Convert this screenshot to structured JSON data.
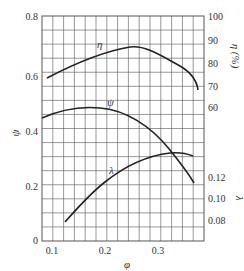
{
  "chart_data": {
    "type": "line",
    "title": "",
    "xlabel": "φ",
    "ylabel": "ψ",
    "y2labels": [
      "η (%)",
      "λ"
    ],
    "x_ticks": [
      0.1,
      0.2,
      0.3
    ],
    "xlim": [
      0.08,
      0.385
    ],
    "y_left": {
      "label": "ψ",
      "ticks": [
        "0",
        "0.2",
        "0.4",
        "0.6",
        "0.8"
      ],
      "range": [
        0,
        0.8
      ]
    },
    "y_right_eta": {
      "label": "η (%)",
      "ticks": [
        "60",
        "70",
        "80",
        "90",
        "100"
      ],
      "range": [
        50,
        100
      ]
    },
    "y_right_lambda": {
      "label": "λ",
      "ticks": [
        "0.08",
        "0.10",
        "0.12"
      ]
    },
    "grid": true,
    "series": [
      {
        "name": "η",
        "axis": "η (%)",
        "x": [
          0.09,
          0.12,
          0.16,
          0.2,
          0.24,
          0.26,
          0.29,
          0.33,
          0.35,
          0.36
        ],
        "values": [
          73,
          77,
          81,
          85,
          87,
          87,
          85,
          80,
          75,
          68
        ]
      },
      {
        "name": "ψ",
        "axis": "ψ",
        "x": [
          0.08,
          0.12,
          0.16,
          0.2,
          0.24,
          0.28,
          0.31,
          0.34,
          0.36
        ],
        "values": [
          0.445,
          0.47,
          0.48,
          0.47,
          0.43,
          0.37,
          0.31,
          0.24,
          0.21
        ]
      },
      {
        "name": "λ",
        "axis": "λ",
        "x": [
          0.12,
          0.15,
          0.18,
          0.21,
          0.24,
          0.27,
          0.3,
          0.33,
          0.36
        ],
        "values": [
          0.078,
          0.092,
          0.105,
          0.116,
          0.125,
          0.133,
          0.139,
          0.141,
          0.14
        ]
      }
    ]
  },
  "labels": {
    "x_axis_title": "φ",
    "y_left_title": "ψ",
    "y_right_eta_title": "η (%)",
    "y_right_lambda_title": "λ",
    "curve_eta": "η",
    "curve_psi": "ψ",
    "curve_lambda": "λ",
    "x_ticks": [
      "0.1",
      "0.2",
      "0.3"
    ],
    "y_left_ticks": [
      "0",
      "0.2",
      "0.4",
      "0.6",
      "0.8"
    ],
    "y_eta_ticks": [
      "60",
      "70",
      "80",
      "90",
      "100"
    ],
    "y_lambda_ticks": [
      "0.08",
      "0.10",
      "0.12"
    ]
  }
}
